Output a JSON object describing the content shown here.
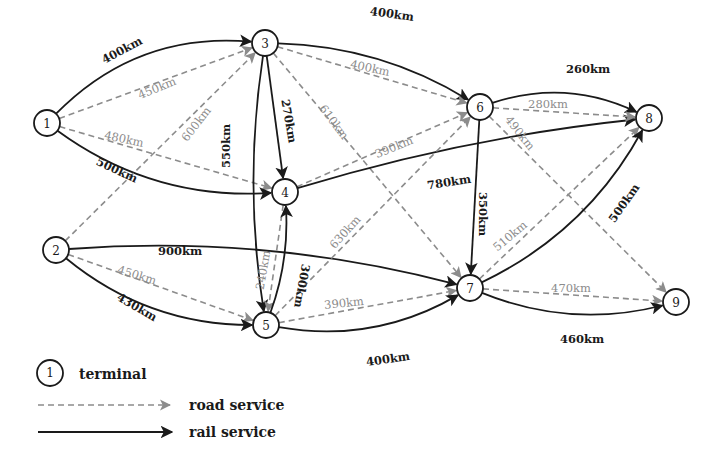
{
  "diagram": {
    "type": "transport-network",
    "colors": {
      "rail": "#1a1a1a",
      "road": "#8c8c8c",
      "node_stroke": "#1a1a1a",
      "background": "#ffffff"
    },
    "nodes": [
      {
        "id": "1",
        "label": "1",
        "x": 47,
        "y": 123
      },
      {
        "id": "2",
        "label": "2",
        "x": 56,
        "y": 250
      },
      {
        "id": "3",
        "label": "3",
        "x": 265,
        "y": 43
      },
      {
        "id": "4",
        "label": "4",
        "x": 285,
        "y": 192
      },
      {
        "id": "5",
        "label": "5",
        "x": 266,
        "y": 325
      },
      {
        "id": "6",
        "label": "6",
        "x": 480,
        "y": 107
      },
      {
        "id": "7",
        "label": "7",
        "x": 470,
        "y": 288
      },
      {
        "id": "8",
        "label": "8",
        "x": 649,
        "y": 118
      },
      {
        "id": "9",
        "label": "9",
        "x": 676,
        "y": 302
      }
    ],
    "edges": [
      {
        "from": "1",
        "to": "3",
        "mode": "rail",
        "label": "400km",
        "curve": -55,
        "lx": 122,
        "ly": 50,
        "rot": -28
      },
      {
        "from": "1",
        "to": "3",
        "mode": "road",
        "label": "450km",
        "curve": 0,
        "lx": 157,
        "ly": 88,
        "rot": -22
      },
      {
        "from": "1",
        "to": "4",
        "mode": "road",
        "label": "480km",
        "curve": 0,
        "lx": 124,
        "ly": 139,
        "rot": 12
      },
      {
        "from": "1",
        "to": "4",
        "mode": "rail",
        "label": "500km",
        "curve": 45,
        "lx": 117,
        "ly": 170,
        "rot": 25
      },
      {
        "from": "2",
        "to": "3",
        "mode": "road",
        "label": "600km",
        "curve": 0,
        "lx": 196,
        "ly": 124,
        "rot": -52
      },
      {
        "from": "2",
        "to": "7",
        "mode": "rail",
        "label": "900km",
        "curve": -35,
        "lx": 180,
        "ly": 251,
        "rot": 0
      },
      {
        "from": "2",
        "to": "5",
        "mode": "road",
        "label": "450km",
        "curve": 0,
        "lx": 137,
        "ly": 275,
        "rot": 17
      },
      {
        "from": "2",
        "to": "5",
        "mode": "rail",
        "label": "430km",
        "curve": 40,
        "lx": 137,
        "ly": 307,
        "rot": 30
      },
      {
        "from": "3",
        "to": "6",
        "mode": "rail",
        "label": "400km",
        "curve": -30,
        "lx": 392,
        "ly": 14,
        "rot": 8
      },
      {
        "from": "3",
        "to": "6",
        "mode": "road",
        "label": "400km",
        "curve": 0,
        "lx": 370,
        "ly": 68,
        "rot": 12
      },
      {
        "from": "3",
        "to": "4",
        "mode": "rail",
        "label": "270km",
        "curve": 0,
        "lx": 289,
        "ly": 121,
        "rot": 80
      },
      {
        "from": "3",
        "to": "5",
        "mode": "rail",
        "label": "550km",
        "curve": 22,
        "lx": 226,
        "ly": 146,
        "rot": -90
      },
      {
        "from": "3",
        "to": "7",
        "mode": "road",
        "label": "610km",
        "curve": 0,
        "lx": 334,
        "ly": 122,
        "rot": 53
      },
      {
        "from": "4",
        "to": "6",
        "mode": "road",
        "label": "390km",
        "curve": 0,
        "lx": 394,
        "ly": 147,
        "rot": -22
      },
      {
        "from": "4",
        "to": "8",
        "mode": "rail",
        "label": "780km",
        "curve": -18,
        "lx": 449,
        "ly": 182,
        "rot": -9
      },
      {
        "from": "4",
        "to": "5",
        "mode": "road",
        "label": "240km",
        "curve": 0,
        "lx": 263,
        "ly": 270,
        "rot": -80
      },
      {
        "from": "5",
        "to": "4",
        "mode": "rail",
        "label": "300km",
        "curve": 14,
        "lx": 302,
        "ly": 286,
        "rot": 100
      },
      {
        "from": "5",
        "to": "6",
        "mode": "road",
        "label": "630km",
        "curve": 0,
        "lx": 345,
        "ly": 232,
        "rot": -48
      },
      {
        "from": "5",
        "to": "7",
        "mode": "road",
        "label": "390km",
        "curve": 0,
        "lx": 344,
        "ly": 303,
        "rot": -6
      },
      {
        "from": "5",
        "to": "7",
        "mode": "rail",
        "label": "400km",
        "curve": 38,
        "lx": 388,
        "ly": 359,
        "rot": -8
      },
      {
        "from": "6",
        "to": "8",
        "mode": "rail",
        "label": "260km",
        "curve": -34,
        "lx": 588,
        "ly": 69,
        "rot": 0
      },
      {
        "from": "6",
        "to": "8",
        "mode": "road",
        "label": "280km",
        "curve": 0,
        "lx": 548,
        "ly": 104,
        "rot": 0
      },
      {
        "from": "6",
        "to": "9",
        "mode": "road",
        "label": "490km",
        "curve": 0,
        "lx": 520,
        "ly": 133,
        "rot": 52
      },
      {
        "from": "6",
        "to": "7",
        "mode": "rail",
        "label": "350km",
        "curve": 0,
        "lx": 483,
        "ly": 214,
        "rot": 90
      },
      {
        "from": "7",
        "to": "8",
        "mode": "road",
        "label": "510km",
        "curve": 0,
        "lx": 510,
        "ly": 236,
        "rot": -40
      },
      {
        "from": "7",
        "to": "8",
        "mode": "rail",
        "label": "500km",
        "curve": 40,
        "lx": 624,
        "ly": 203,
        "rot": -55
      },
      {
        "from": "7",
        "to": "9",
        "mode": "road",
        "label": "470km",
        "curve": 0,
        "lx": 571,
        "ly": 288,
        "rot": 0
      },
      {
        "from": "7",
        "to": "9",
        "mode": "rail",
        "label": "460km",
        "curve": 34,
        "lx": 582,
        "ly": 339,
        "rot": 0
      }
    ]
  },
  "legend": {
    "terminal": {
      "symbol": "1",
      "label": "terminal"
    },
    "road": {
      "label": "road service"
    },
    "rail": {
      "label": "rail service"
    }
  }
}
